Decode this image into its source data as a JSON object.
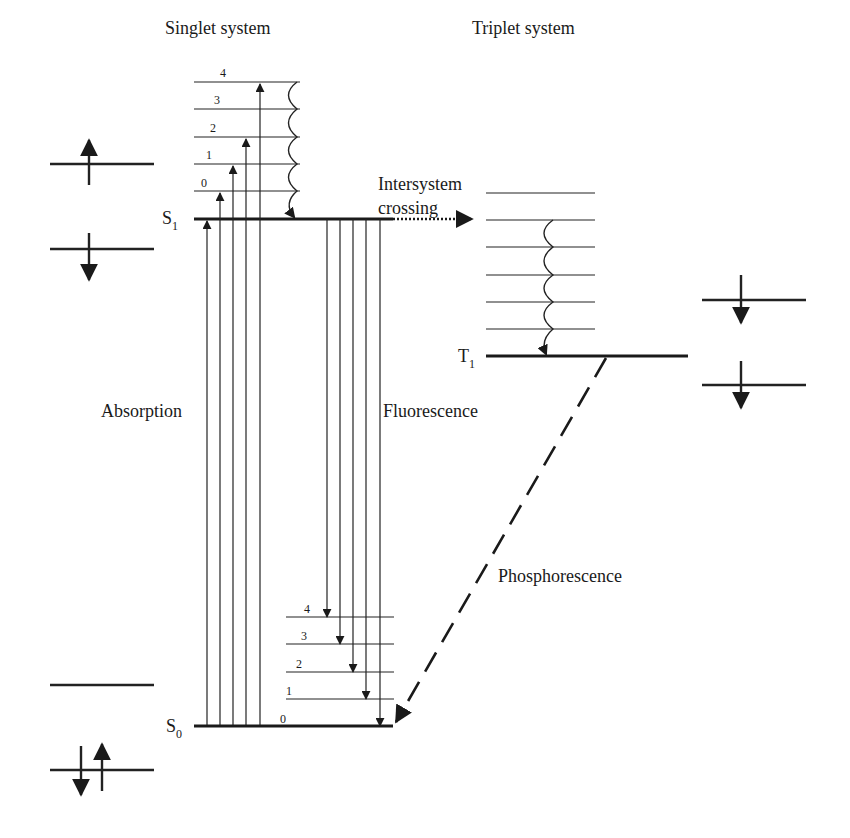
{
  "diagram": {
    "type": "jablonski",
    "headers": {
      "singlet": "Singlet system",
      "triplet": "Triplet system"
    },
    "states": {
      "S1": {
        "base": "S",
        "sub": "1"
      },
      "S0": {
        "base": "S",
        "sub": "0"
      },
      "T1": {
        "base": "T",
        "sub": "1"
      }
    },
    "s1_vibrational_levels": [
      "0",
      "1",
      "2",
      "3",
      "4"
    ],
    "s0_vibrational_levels": [
      "0",
      "1",
      "2",
      "3",
      "4"
    ],
    "triplet_vibrational_level_count": 6,
    "processes": {
      "absorption": "Absorption",
      "fluorescence": "Fluorescence",
      "isc_line1": "Intersystem",
      "isc_line2": "crossing",
      "phosphorescence": "Phosphorescence"
    },
    "electron_spin_panels": {
      "left_upper": "excited singlet: one electron up (upper orbital), one electron down (lower orbital)",
      "left_lower": "ground state: empty upper orbital, paired electrons (down, up) in lower orbital",
      "right": "triplet: both electrons spin down (parallel)"
    },
    "colors": {
      "ink": "#222222",
      "background": "#ffffff"
    }
  }
}
